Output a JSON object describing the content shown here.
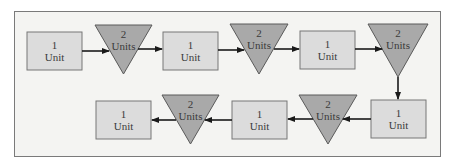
{
  "diagram": {
    "colors": {
      "frame_bg": "#f4f4f2",
      "frame_border": "#7a7a7a",
      "box_fill": "#dcdcdc",
      "box_stroke": "#777777",
      "triangle_fill": "#a9a9a9",
      "triangle_stroke": "#5a5a5a",
      "arrow": "#1a1a1a",
      "text": "#3a3a3a"
    },
    "nodes": [
      {
        "id": "box1",
        "shape": "rectangle",
        "line1": "1",
        "line2": "Unit"
      },
      {
        "id": "tri1",
        "shape": "inverted-triangle",
        "line1": "2",
        "line2": "Units"
      },
      {
        "id": "box2",
        "shape": "rectangle",
        "line1": "1",
        "line2": "Unit"
      },
      {
        "id": "tri2",
        "shape": "inverted-triangle",
        "line1": "2",
        "line2": "Units"
      },
      {
        "id": "box3",
        "shape": "rectangle",
        "line1": "1",
        "line2": "Unit"
      },
      {
        "id": "tri3",
        "shape": "inverted-triangle",
        "line1": "2",
        "line2": "Units"
      },
      {
        "id": "box4",
        "shape": "rectangle",
        "line1": "1",
        "line2": "Unit"
      },
      {
        "id": "tri4",
        "shape": "inverted-triangle",
        "line1": "2",
        "line2": "Units"
      },
      {
        "id": "box5",
        "shape": "rectangle",
        "line1": "1",
        "line2": "Unit"
      },
      {
        "id": "tri5",
        "shape": "inverted-triangle",
        "line1": "2",
        "line2": "Units"
      },
      {
        "id": "box6",
        "shape": "rectangle",
        "line1": "1",
        "line2": "Unit"
      }
    ],
    "edges": [
      {
        "from": "box1",
        "to": "tri1"
      },
      {
        "from": "tri1",
        "to": "box2"
      },
      {
        "from": "box2",
        "to": "tri2"
      },
      {
        "from": "tri2",
        "to": "box3"
      },
      {
        "from": "box3",
        "to": "tri3"
      },
      {
        "from": "tri3",
        "to": "box4"
      },
      {
        "from": "box4",
        "to": "tri4"
      },
      {
        "from": "tri4",
        "to": "box5"
      },
      {
        "from": "box5",
        "to": "tri5"
      },
      {
        "from": "tri5",
        "to": "box6"
      }
    ]
  }
}
